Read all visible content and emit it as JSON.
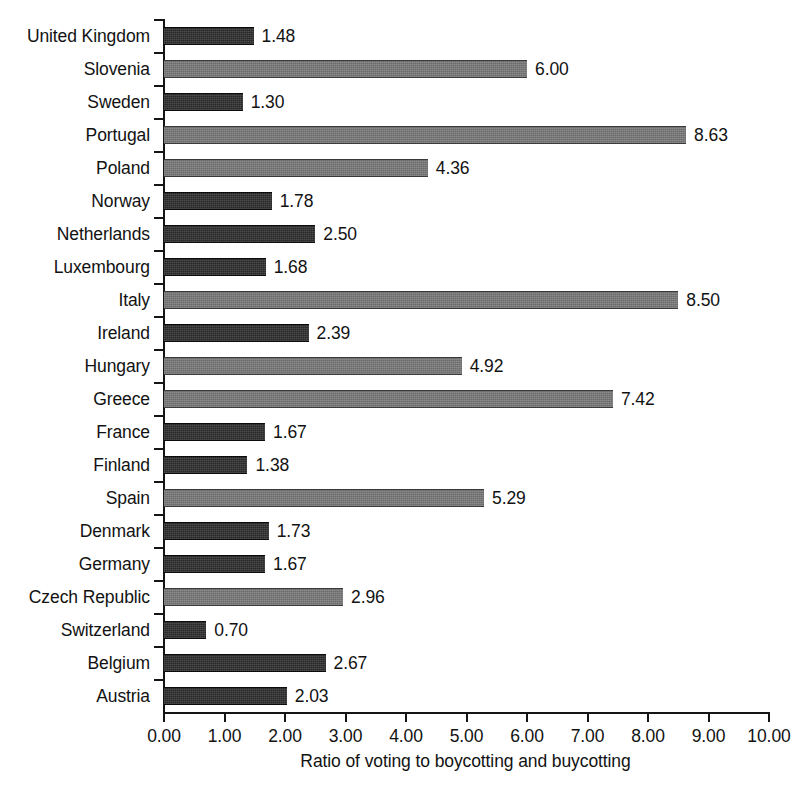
{
  "chart_data": {
    "type": "bar",
    "orientation": "horizontal",
    "title": "",
    "xlabel": "Ratio of voting to boycotting and buycotting",
    "ylabel": "",
    "xlim": [
      0,
      10
    ],
    "xticks": [
      "0.00",
      "1.00",
      "2.00",
      "3.00",
      "4.00",
      "5.00",
      "6.00",
      "7.00",
      "8.00",
      "9.00",
      "10.00"
    ],
    "grid": false,
    "legend": null,
    "categories": [
      "United Kingdom",
      "Slovenia",
      "Sweden",
      "Portugal",
      "Poland",
      "Norway",
      "Netherlands",
      "Luxembourg",
      "Italy",
      "Ireland",
      "Hungary",
      "Greece",
      "France",
      "Finland",
      "Spain",
      "Denmark",
      "Germany",
      "Czech Republic",
      "Switzerland",
      "Belgium",
      "Austria"
    ],
    "values": [
      1.48,
      6.0,
      1.3,
      8.63,
      4.36,
      1.78,
      2.5,
      1.68,
      8.5,
      2.39,
      4.92,
      7.42,
      1.67,
      1.38,
      5.29,
      1.73,
      1.67,
      2.96,
      0.7,
      2.67,
      2.03
    ],
    "value_labels": [
      "1.48",
      "6.00",
      "1.30",
      "8.63",
      "4.36",
      "1.78",
      "2.50",
      "1.68",
      "8.50",
      "2.39",
      "4.92",
      "7.42",
      "1.67",
      "1.38",
      "5.29",
      "1.73",
      "1.67",
      "2.96",
      "0.70",
      "2.67",
      "2.03"
    ],
    "bar_shades": [
      "dark",
      "light",
      "dark",
      "light",
      "light",
      "dark",
      "dark",
      "dark",
      "light",
      "dark",
      "light",
      "light",
      "dark",
      "dark",
      "light",
      "dark",
      "dark",
      "light",
      "dark",
      "dark",
      "dark"
    ],
    "colors": {
      "dark_bar": "#272727",
      "light_bar": "#6b6b6b",
      "axis": "#141414",
      "text": "#121212",
      "background": "#ffffff"
    }
  }
}
